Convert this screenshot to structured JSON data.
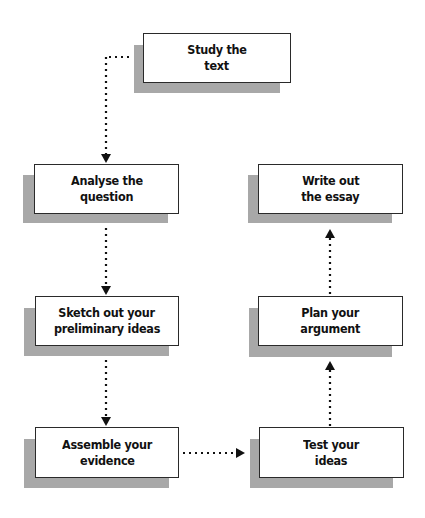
{
  "diagram": {
    "type": "flowchart",
    "nodes": [
      {
        "id": "study",
        "lines": [
          "Study the",
          "text"
        ]
      },
      {
        "id": "analyse",
        "lines": [
          "Analyse the",
          "question"
        ]
      },
      {
        "id": "sketch",
        "lines": [
          "Sketch out your",
          "preliminary ideas"
        ]
      },
      {
        "id": "assemble",
        "lines": [
          "Assemble your",
          "evidence"
        ]
      },
      {
        "id": "test",
        "lines": [
          "Test your",
          "ideas"
        ]
      },
      {
        "id": "plan",
        "lines": [
          "Plan your",
          "argument"
        ]
      },
      {
        "id": "write",
        "lines": [
          "Write out",
          "the essay"
        ]
      }
    ],
    "edges": [
      {
        "from": "study",
        "to": "analyse",
        "style": "dotted"
      },
      {
        "from": "analyse",
        "to": "sketch",
        "style": "dotted"
      },
      {
        "from": "sketch",
        "to": "assemble",
        "style": "dotted"
      },
      {
        "from": "assemble",
        "to": "test",
        "style": "dotted"
      },
      {
        "from": "test",
        "to": "plan",
        "style": "dotted"
      },
      {
        "from": "plan",
        "to": "write",
        "style": "dotted"
      }
    ],
    "colors": {
      "shadow": "#a8a8a8",
      "border": "#2a2a2a",
      "text": "#111111"
    }
  }
}
